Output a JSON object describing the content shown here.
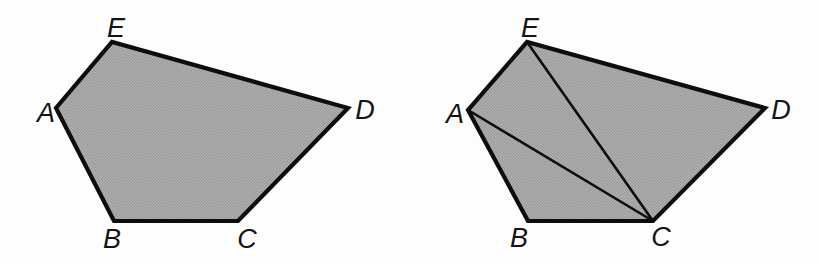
{
  "figure": {
    "background": "#fdfdfd",
    "fill_base_color": "#b4b4b4",
    "fill_dot_color": "#979797",
    "stroke_color": "#0d0d0d",
    "outline_width": 4.2,
    "diagonal_width": 2.6,
    "label_font_size": 27,
    "panels": [
      {
        "name": "pentagon-plain",
        "vertices": [
          {
            "label": "A",
            "x": 56,
            "y": 108,
            "lx": 46,
            "ly": 113
          },
          {
            "label": "B",
            "x": 114,
            "y": 221,
            "lx": 112,
            "ly": 239
          },
          {
            "label": "C",
            "x": 238,
            "y": 221,
            "lx": 247,
            "ly": 239
          },
          {
            "label": "D",
            "x": 348,
            "y": 108,
            "lx": 365,
            "ly": 110
          },
          {
            "label": "E",
            "x": 112,
            "y": 42,
            "lx": 116,
            "ly": 28
          }
        ],
        "diagonals": []
      },
      {
        "name": "pentagon-triangulated",
        "vertices": [
          {
            "label": "A",
            "x": 468,
            "y": 110,
            "lx": 455,
            "ly": 114
          },
          {
            "label": "B",
            "x": 528,
            "y": 221,
            "lx": 519,
            "ly": 238
          },
          {
            "label": "C",
            "x": 653,
            "y": 221,
            "lx": 661,
            "ly": 237
          },
          {
            "label": "D",
            "x": 765,
            "y": 108,
            "lx": 781,
            "ly": 110
          },
          {
            "label": "E",
            "x": 527,
            "y": 42,
            "lx": 530,
            "ly": 28
          }
        ],
        "diagonals": [
          [
            "E",
            "C"
          ],
          [
            "A",
            "C"
          ]
        ]
      }
    ]
  }
}
